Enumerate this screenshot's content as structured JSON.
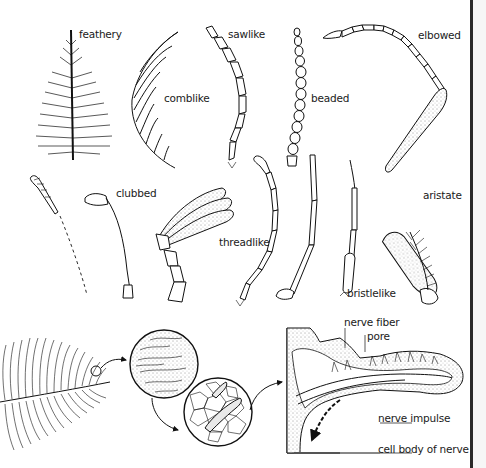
{
  "figure": {
    "antenna_types": [
      {
        "id": "feathery",
        "label": "feathery"
      },
      {
        "id": "comblike",
        "label": "comblike"
      },
      {
        "id": "sawlike",
        "label": "sawlike"
      },
      {
        "id": "beaded",
        "label": "beaded"
      },
      {
        "id": "elbowed",
        "label": "elbowed"
      },
      {
        "id": "clubbed",
        "label": "clubbed"
      },
      {
        "id": "threadlike",
        "label": "threadlike"
      },
      {
        "id": "bristlelike",
        "label": "bristlelike"
      },
      {
        "id": "aristate",
        "label": "aristate"
      }
    ],
    "sensory_detail": {
      "labels": {
        "nerve_fiber": "nerve fiber",
        "pore": "pore",
        "nerve_impulse": "nerve impulse",
        "cell_body": "cell body of nerve"
      }
    },
    "colors": {
      "ink": "#111111",
      "background": "#ffffff",
      "rule": "#2a2a2a"
    }
  }
}
